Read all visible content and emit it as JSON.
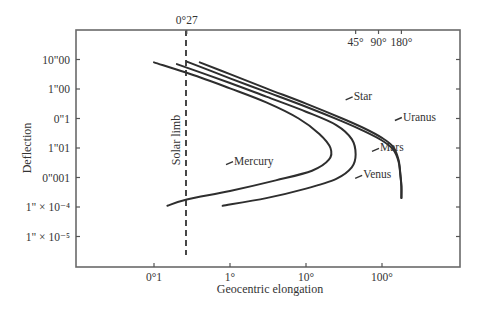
{
  "chart_data": {
    "type": "line",
    "title": "",
    "xlabel": "Geocentric elongation",
    "ylabel": "Deflection",
    "x_scale": "log",
    "y_scale": "log",
    "x_ticks": [
      {
        "value": 0.1,
        "label": "0°1"
      },
      {
        "value": 1,
        "label": "1°"
      },
      {
        "value": 10,
        "label": "10°"
      },
      {
        "value": 100,
        "label": "100°"
      }
    ],
    "x_top_ticks": [
      {
        "value": 0.27,
        "label": "0°27"
      },
      {
        "value": 45,
        "label": "45°"
      },
      {
        "value": 90,
        "label": "90°"
      },
      {
        "value": 180,
        "label": "180°"
      }
    ],
    "y_ticks": [
      {
        "value": 10,
        "label": "10\"00"
      },
      {
        "value": 1,
        "label": "1\"00"
      },
      {
        "value": 0.1,
        "label": "0\"1"
      },
      {
        "value": 0.01,
        "label": "1\"01"
      },
      {
        "value": 0.001,
        "label": "0\"001"
      },
      {
        "value": 0.0001,
        "label": "1\" × 10⁻⁴"
      },
      {
        "value": 1e-05,
        "label": "1\" × 10⁻⁵"
      }
    ],
    "xlim": [
      0.015,
      600
    ],
    "ylim": [
      1e-06,
      100
    ],
    "grid": false,
    "legend": "inline labels",
    "annotations": [
      {
        "text": "Solar limb",
        "x": 0.27,
        "style": "dashed vertical line"
      }
    ],
    "series": [
      {
        "name": "Star",
        "points": [
          [
            0.4,
            8
          ],
          [
            1,
            3.2
          ],
          [
            3,
            1.05
          ],
          [
            10,
            0.32
          ],
          [
            30,
            0.1
          ],
          [
            60,
            0.045
          ],
          [
            100,
            0.022
          ],
          [
            140,
            0.011
          ],
          [
            165,
            0.004
          ],
          [
            175,
            0.0012
          ],
          [
            180,
            0.0005
          ],
          [
            180,
            0.0002
          ]
        ]
      },
      {
        "name": "Uranus",
        "points": [
          [
            0.27,
            8.5
          ],
          [
            1,
            2.3
          ],
          [
            3,
            0.8
          ],
          [
            10,
            0.25
          ],
          [
            30,
            0.08
          ],
          [
            60,
            0.036
          ],
          [
            100,
            0.018
          ],
          [
            140,
            0.009
          ],
          [
            165,
            0.0035
          ],
          [
            175,
            0.0011
          ],
          [
            180,
            0.0005
          ],
          [
            180,
            0.0002
          ]
        ]
      },
      {
        "name": "Mars",
        "points": [
          [
            0.2,
            7
          ],
          [
            1,
            1.6
          ],
          [
            3,
            0.55
          ],
          [
            10,
            0.17
          ],
          [
            25,
            0.06
          ],
          [
            40,
            0.02
          ],
          [
            45,
            0.006
          ],
          [
            40,
            0.0022
          ],
          [
            25,
            0.0009
          ],
          [
            10,
            0.00042
          ],
          [
            3,
            0.0002
          ],
          [
            0.8,
            0.00011
          ]
        ]
      },
      {
        "name": "Venus",
        "points": [
          [
            0.2,
            7
          ],
          [
            1,
            1.6
          ],
          [
            3,
            0.55
          ],
          [
            10,
            0.17
          ],
          [
            25,
            0.06
          ],
          [
            40,
            0.02
          ],
          [
            45,
            0.006
          ],
          [
            40,
            0.0022
          ],
          [
            25,
            0.0009
          ],
          [
            10,
            0.00042
          ],
          [
            3,
            0.0002
          ],
          [
            0.8,
            0.00011
          ]
        ]
      },
      {
        "name": "Mercury",
        "points": [
          [
            0.1,
            8
          ],
          [
            0.4,
            2.5
          ],
          [
            1,
            1.05
          ],
          [
            3,
            0.35
          ],
          [
            8,
            0.1
          ],
          [
            15,
            0.03
          ],
          [
            21,
            0.01
          ],
          [
            20,
            0.004
          ],
          [
            12,
            0.0017
          ],
          [
            4,
            0.0008
          ],
          [
            1,
            0.00035
          ],
          [
            0.27,
            0.00018
          ],
          [
            0.15,
            0.00011
          ]
        ]
      }
    ],
    "labels": [
      {
        "series": "Star",
        "text": "Star",
        "x": 45,
        "y": 0.5
      },
      {
        "series": "Uranus",
        "text": "Uranus",
        "x": 200,
        "y": 0.1
      },
      {
        "series": "Mars",
        "text": "Mars",
        "x": 100,
        "y": 0.009
      },
      {
        "series": "Venus",
        "text": "Venus",
        "x": 60,
        "y": 0.0011
      },
      {
        "series": "Mercury",
        "text": "Mercury",
        "x": 1.2,
        "y": 0.0032
      }
    ]
  },
  "axes": {
    "xlabel": "Geocentric elongation",
    "ylabel": "Deflection",
    "limb_label": "Solar limb"
  }
}
